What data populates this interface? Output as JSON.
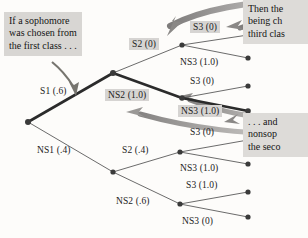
{
  "figure": {
    "type": "probability-tree-diagram",
    "title": "",
    "background_color": "#fdfcfa"
  },
  "callouts": [
    {
      "id": "callout-left",
      "text": "If a sophomore\nwas chosen from\nthe first class . . .",
      "x": 4,
      "y": 12,
      "width": 92
    },
    {
      "id": "callout-top-right",
      "text": "Then the\nbeing ch\nthird clas",
      "x": 243,
      "y": 0,
      "width": 65
    },
    {
      "id": "callout-bottom-right",
      "text": ". . . and\nnonsop\nthe seco",
      "x": 243,
      "y": 113,
      "width": 65
    }
  ],
  "nodes": [
    {
      "id": "root",
      "x": 28,
      "y": 122,
      "level": 0
    },
    {
      "id": "s1",
      "x": 113,
      "y": 73,
      "level": 1
    },
    {
      "id": "ns1",
      "x": 113,
      "y": 172,
      "level": 1
    },
    {
      "id": "s1s2",
      "x": 182,
      "y": 45,
      "level": 2
    },
    {
      "id": "s1ns2",
      "x": 182,
      "y": 98,
      "level": 2
    },
    {
      "id": "ns1s2",
      "x": 180,
      "y": 152,
      "level": 2
    },
    {
      "id": "ns1ns2",
      "x": 180,
      "y": 204,
      "level": 2
    },
    {
      "id": "leaf1",
      "x": 248,
      "y": 35,
      "level": 3
    },
    {
      "id": "leaf2",
      "x": 248,
      "y": 58,
      "level": 3
    },
    {
      "id": "leaf3",
      "x": 248,
      "y": 86,
      "level": 3
    },
    {
      "id": "leaf4",
      "x": 248,
      "y": 111,
      "level": 3
    },
    {
      "id": "leaf5",
      "x": 248,
      "y": 140,
      "level": 3
    },
    {
      "id": "leaf6",
      "x": 248,
      "y": 164,
      "level": 3
    },
    {
      "id": "leaf7",
      "x": 248,
      "y": 192,
      "level": 3
    },
    {
      "id": "leaf8",
      "x": 248,
      "y": 217,
      "level": 3
    }
  ],
  "edges": [
    {
      "id": "edge-root-s1",
      "from": "root",
      "to": "s1",
      "emphasis": true
    },
    {
      "id": "edge-root-ns1",
      "from": "root",
      "to": "ns1",
      "emphasis": false
    },
    {
      "id": "edge-s1-s2",
      "from": "s1",
      "to": "s1s2",
      "emphasis": false
    },
    {
      "id": "edge-s1-ns2",
      "from": "s1",
      "to": "s1ns2",
      "emphasis": true
    },
    {
      "id": "edge-ns1-s2",
      "from": "ns1",
      "to": "ns1s2",
      "emphasis": false
    },
    {
      "id": "edge-ns1-ns2",
      "from": "ns1",
      "to": "ns1ns2",
      "emphasis": false
    },
    {
      "id": "edge-s1s2-leaf1",
      "from": "s1s2",
      "to": "leaf1",
      "emphasis": false
    },
    {
      "id": "edge-s1s2-leaf2",
      "from": "s1s2",
      "to": "leaf2",
      "emphasis": false
    },
    {
      "id": "edge-s1ns2-leaf3",
      "from": "s1ns2",
      "to": "leaf3",
      "emphasis": false
    },
    {
      "id": "edge-s1ns2-leaf4",
      "from": "s1ns2",
      "to": "leaf4",
      "emphasis": true
    },
    {
      "id": "edge-ns1s2-leaf5",
      "from": "ns1s2",
      "to": "leaf5",
      "emphasis": false
    },
    {
      "id": "edge-ns1s2-leaf6",
      "from": "ns1s2",
      "to": "leaf6",
      "emphasis": false
    },
    {
      "id": "edge-ns1ns2-leaf7",
      "from": "ns1ns2",
      "to": "leaf7",
      "emphasis": false
    },
    {
      "id": "edge-ns1ns2-leaf8",
      "from": "ns1ns2",
      "to": "leaf8",
      "emphasis": false
    }
  ],
  "branch_labels": [
    {
      "id": "label-s1",
      "text": "S1 (.6)",
      "x": 40,
      "y": 86,
      "highlight": false
    },
    {
      "id": "label-ns1",
      "text": "NS1 (.4)",
      "x": 37,
      "y": 145,
      "highlight": false
    },
    {
      "id": "label-s2-top",
      "text": "S2 (0)",
      "x": 129,
      "y": 38,
      "highlight": true
    },
    {
      "id": "label-ns2-top",
      "text": "NS2 (1.0)",
      "x": 105,
      "y": 89,
      "highlight": true
    },
    {
      "id": "label-s2-bot",
      "text": "S2 (.4)",
      "x": 122,
      "y": 145,
      "highlight": false
    },
    {
      "id": "label-ns2-bot",
      "text": "NS2 (.6)",
      "x": 116,
      "y": 196,
      "highlight": false
    },
    {
      "id": "label-leaf1",
      "text": "S3 (0)",
      "x": 190,
      "y": 21,
      "highlight": true
    },
    {
      "id": "label-leaf2",
      "text": "NS3 (1.0)",
      "x": 180,
      "y": 57,
      "highlight": false
    },
    {
      "id": "label-leaf3",
      "text": "S3 (0)",
      "x": 190,
      "y": 76,
      "highlight": false
    },
    {
      "id": "label-leaf4",
      "text": "NS3 (1.0)",
      "x": 178,
      "y": 105,
      "highlight": true
    },
    {
      "id": "label-leaf5",
      "text": "S3 (0)",
      "x": 190,
      "y": 127,
      "highlight": false
    },
    {
      "id": "label-leaf6",
      "text": "NS3 (1.0)",
      "x": 180,
      "y": 163,
      "highlight": false
    },
    {
      "id": "label-leaf7",
      "text": "S3 (1.0)",
      "x": 186,
      "y": 180,
      "highlight": false
    },
    {
      "id": "label-leaf8",
      "text": "NS3 (0)",
      "x": 182,
      "y": 216,
      "highlight": false
    }
  ],
  "pointer_arrows": [
    {
      "id": "arrow-callout-left-to-s1",
      "style": "dark-gray-thin"
    },
    {
      "id": "arrow-top-to-s2",
      "style": "gray-thick-curve"
    },
    {
      "id": "arrow-top-to-s3",
      "style": "gray-thick-curve"
    },
    {
      "id": "arrow-bottom-to-ns2",
      "style": "gray-thick-curve"
    },
    {
      "id": "arrow-bottom-to-ns3",
      "style": "gray-thick-curve"
    }
  ],
  "colors": {
    "node": "#3a3a3a",
    "edge": "#5a5a5a",
    "edge_emphasis": "#2b2b2b",
    "arrow_gray": "#9c9a98",
    "label_highlight": "#d6d4d2",
    "callout_bg": "#d8d6d3",
    "text": "#1b1b1b"
  }
}
